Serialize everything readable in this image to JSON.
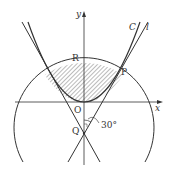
{
  "diagram": {
    "labels": {
      "y_axis": "y",
      "x_axis": "x",
      "origin": "O",
      "point_R": "R",
      "point_P": "P",
      "point_Q": "Q",
      "curve_C": "C",
      "line_l": "l",
      "angle": "30°"
    },
    "colors": {
      "stroke": "#333333",
      "hatch": "#555555",
      "background": "#ffffff"
    }
  }
}
